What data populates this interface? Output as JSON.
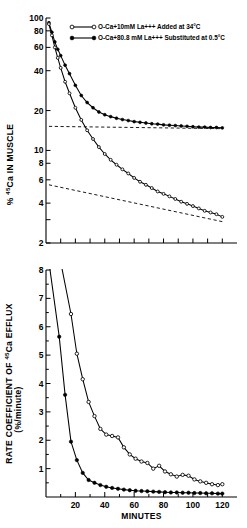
{
  "figure": {
    "title": "",
    "panels": [
      "top",
      "bottom"
    ]
  },
  "legend": {
    "position": "top-right",
    "entries": [
      {
        "marker": "open-circle",
        "label": "O-Ca+10mM La+++ Added at 34°C"
      },
      {
        "marker": "filled-circle",
        "label": "O-Ca+80.8 mM La+++ Substituted at 0.5°C"
      }
    ]
  },
  "chart_data": [
    {
      "type": "line",
      "panel": "top",
      "title": "",
      "xlabel": "",
      "ylabel": "% 45Ca IN MUSCLE",
      "ylabel_parts": {
        "prefix": "% ",
        "sup": "45",
        "suffix": "Ca IN MUSCLE"
      },
      "yscale": "log",
      "ylim": [
        2,
        100
      ],
      "ytick_values": [
        100,
        80,
        60,
        40,
        20,
        10,
        8,
        6,
        4,
        3,
        2
      ],
      "ytick_labels": [
        "100",
        "80",
        "60",
        "40",
        "20",
        "10",
        "8",
        "6",
        "4",
        "",
        "2"
      ],
      "xlim": [
        0,
        130
      ],
      "xtick_values": [
        0,
        10,
        20,
        30,
        40,
        50,
        60,
        70,
        80,
        90,
        100,
        110,
        120
      ],
      "xtick_labels": [
        "",
        "",
        "",
        "",
        "",
        "",
        "",
        "",
        "",
        "",
        "",
        "",
        ""
      ],
      "grid": false,
      "series": [
        {
          "name": "O-Ca+80.8 mM La+++ Substituted at 0.5°C",
          "marker": "filled-circle",
          "x": [
            2,
            4,
            6,
            8,
            10,
            13,
            16,
            20,
            24,
            28,
            32,
            36,
            40,
            44,
            48,
            52,
            56,
            60,
            64,
            68,
            72,
            76,
            80,
            84,
            88,
            92,
            96,
            100,
            104,
            108,
            112,
            116,
            120
          ],
          "y": [
            92,
            78,
            66,
            58,
            52,
            44,
            38,
            31,
            26,
            23,
            21,
            19.5,
            18.6,
            18.0,
            17.5,
            17.1,
            16.8,
            16.5,
            16.3,
            16.1,
            15.9,
            15.8,
            15.6,
            15.5,
            15.4,
            15.3,
            15.2,
            15.1,
            15.0,
            15.0,
            14.9,
            14.9,
            14.8
          ]
        },
        {
          "name": "O-Ca+10mM La+++ Added at 34°C",
          "marker": "open-circle",
          "x": [
            2,
            4,
            6,
            8,
            10,
            13,
            16,
            20,
            24,
            28,
            32,
            36,
            40,
            44,
            48,
            52,
            56,
            60,
            64,
            68,
            72,
            76,
            80,
            84,
            88,
            92,
            96,
            100,
            104,
            108,
            112,
            116,
            120
          ],
          "y": [
            90,
            74,
            60,
            50,
            42,
            33,
            27,
            21,
            17,
            14.2,
            12.2,
            10.6,
            9.4,
            8.5,
            7.8,
            7.2,
            6.7,
            6.2,
            5.8,
            5.5,
            5.2,
            4.9,
            4.7,
            4.5,
            4.3,
            4.1,
            3.95,
            3.8,
            3.65,
            3.5,
            3.4,
            3.3,
            3.15
          ]
        }
      ],
      "annotations": [
        {
          "type": "dashed-asymptote",
          "series": "filled-circle",
          "from": [
            2,
            15.2
          ],
          "to": [
            120,
            14.6
          ],
          "note": "horizontal extrapolation near 15%"
        },
        {
          "type": "dashed-asymptote",
          "series": "open-circle",
          "from": [
            2,
            5.5
          ],
          "to": [
            120,
            2.9
          ],
          "note": "slow-component extrapolation"
        }
      ]
    },
    {
      "type": "line",
      "panel": "bottom",
      "title": "",
      "xlabel": "MINUTES",
      "ylabel": "RATE COEFFICIENT OF 45Ca EFFLUX (%/minute)",
      "ylabel_parts": {
        "line1_prefix": "RATE COEFFICIENT OF ",
        "line1_sup": "45",
        "line1_suffix": "Ca EFFLUX",
        "line2": "(%/minute)"
      },
      "yscale": "linear",
      "ylim": [
        0,
        8
      ],
      "ytick_values": [
        1,
        2,
        3,
        4,
        5,
        6,
        7,
        8
      ],
      "ytick_labels": [
        "1",
        "2",
        "3",
        "4",
        "5",
        "6",
        "7",
        "8"
      ],
      "yminor_values": [
        0.5,
        1.5,
        2.5,
        3.5,
        4.5,
        5.5,
        6.5,
        7.5
      ],
      "xlim": [
        0,
        130
      ],
      "xtick_values": [
        20,
        40,
        60,
        80,
        100,
        120
      ],
      "xtick_labels": [
        "20",
        "40",
        "60",
        "80",
        "100",
        "120"
      ],
      "xminor_values": [
        10,
        30,
        50,
        70,
        90,
        110
      ],
      "grid": false,
      "series": [
        {
          "name": "O-Ca+10mM La+++ Added at 34°C",
          "marker": "open-circle",
          "x": [
            17,
            21,
            25,
            29,
            33,
            37,
            41,
            45,
            49,
            53,
            57,
            61,
            65,
            69,
            73,
            77,
            81,
            85,
            89,
            93,
            97,
            101,
            105,
            109,
            113,
            117,
            120
          ],
          "y": [
            6.45,
            5.05,
            4.15,
            3.35,
            2.85,
            2.4,
            2.2,
            2.15,
            2.1,
            1.75,
            1.5,
            1.35,
            1.25,
            1.2,
            1.0,
            1.1,
            0.9,
            0.8,
            0.72,
            0.78,
            0.75,
            0.62,
            0.55,
            0.5,
            0.45,
            0.42,
            0.45
          ]
        },
        {
          "name": "O-Ca+80.8 mM La+++ Substituted at 0.5°C",
          "marker": "filled-circle",
          "x": [
            9,
            13,
            17,
            21,
            25,
            29,
            33,
            37,
            41,
            45,
            49,
            53,
            57,
            61,
            65,
            69,
            73,
            77,
            81,
            85,
            89,
            93,
            97,
            101,
            105,
            109,
            113,
            117,
            120
          ],
          "y": [
            5.65,
            3.6,
            1.95,
            1.3,
            0.85,
            0.6,
            0.5,
            0.42,
            0.36,
            0.32,
            0.29,
            0.26,
            0.24,
            0.22,
            0.21,
            0.2,
            0.19,
            0.18,
            0.17,
            0.16,
            0.16,
            0.15,
            0.15,
            0.14,
            0.14,
            0.13,
            0.13,
            0.12,
            0.12
          ]
        }
      ],
      "annotations": []
    }
  ]
}
